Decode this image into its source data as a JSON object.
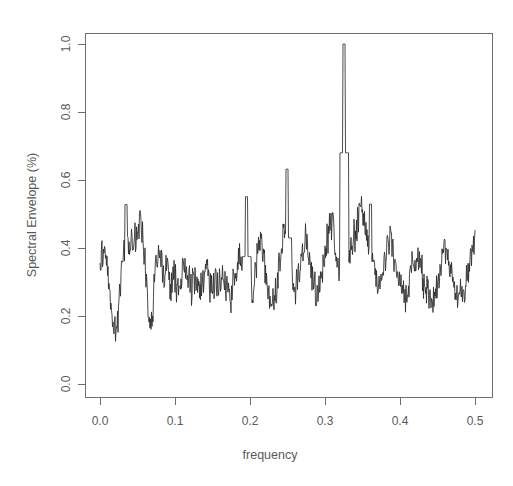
{
  "chart_data": {
    "type": "line",
    "title": "",
    "xlabel": "frequency",
    "ylabel": "Spectral Envelope (%)",
    "xlim": [
      0.0,
      0.5
    ],
    "ylim": [
      0.0,
      1.0
    ],
    "grid": false,
    "legend": null,
    "xticks": [
      "0.0",
      "0.1",
      "0.2",
      "0.3",
      "0.4",
      "0.5"
    ],
    "xtick_values": [
      0.0,
      0.1,
      0.2,
      0.3,
      0.4,
      0.5
    ],
    "yticks": [
      "0.0",
      "0.2",
      "0.4",
      "0.6",
      "0.8",
      "1.0"
    ],
    "ytick_values": [
      0.0,
      0.2,
      0.4,
      0.6,
      0.8,
      1.0
    ],
    "line_color": "#2b2b2b",
    "axis_color": "#6e6e6e",
    "text_color": "#5a5a5a",
    "background": "#ffffff",
    "annotations": [
      {
        "label": "dominant peak",
        "x": 0.3255,
        "y": 1.0
      },
      {
        "label": "secondary peak",
        "x": 0.2495,
        "y": 0.632
      },
      {
        "label": "secondary peak",
        "x": 0.1955,
        "y": 0.551
      },
      {
        "label": "secondary peak",
        "x": 0.3605,
        "y": 0.529
      },
      {
        "label": "secondary peak",
        "x": 0.0345,
        "y": 0.528
      }
    ],
    "x": [
      0.0,
      0.002,
      0.004,
      0.006,
      0.008,
      0.01,
      0.012,
      0.014,
      0.016,
      0.018,
      0.02,
      0.022,
      0.024,
      0.026,
      0.028,
      0.03,
      0.032,
      0.034,
      0.036,
      0.038,
      0.04,
      0.042,
      0.044,
      0.046,
      0.048,
      0.05,
      0.052,
      0.054,
      0.056,
      0.058,
      0.06,
      0.062,
      0.064,
      0.066,
      0.068,
      0.07,
      0.072,
      0.074,
      0.076,
      0.078,
      0.08,
      0.082,
      0.084,
      0.086,
      0.088,
      0.09,
      0.092,
      0.094,
      0.096,
      0.098,
      0.1,
      0.102,
      0.104,
      0.106,
      0.108,
      0.11,
      0.112,
      0.114,
      0.116,
      0.118,
      0.12,
      0.122,
      0.124,
      0.126,
      0.128,
      0.13,
      0.132,
      0.134,
      0.136,
      0.138,
      0.14,
      0.142,
      0.144,
      0.146,
      0.148,
      0.15,
      0.152,
      0.154,
      0.156,
      0.158,
      0.16,
      0.162,
      0.164,
      0.166,
      0.168,
      0.17,
      0.172,
      0.174,
      0.176,
      0.178,
      0.18,
      0.182,
      0.184,
      0.186,
      0.188,
      0.19,
      0.192,
      0.194,
      0.196,
      0.198,
      0.2,
      0.202,
      0.204,
      0.206,
      0.208,
      0.21,
      0.212,
      0.214,
      0.216,
      0.218,
      0.22,
      0.222,
      0.224,
      0.226,
      0.228,
      0.23,
      0.232,
      0.234,
      0.236,
      0.238,
      0.24,
      0.242,
      0.244,
      0.246,
      0.248,
      0.25,
      0.252,
      0.254,
      0.256,
      0.258,
      0.26,
      0.262,
      0.264,
      0.266,
      0.268,
      0.27,
      0.272,
      0.274,
      0.276,
      0.278,
      0.28,
      0.282,
      0.284,
      0.286,
      0.288,
      0.29,
      0.292,
      0.294,
      0.296,
      0.298,
      0.3,
      0.302,
      0.304,
      0.306,
      0.308,
      0.31,
      0.312,
      0.314,
      0.316,
      0.318,
      0.32,
      0.322,
      0.324,
      0.326,
      0.328,
      0.33,
      0.332,
      0.334,
      0.336,
      0.338,
      0.34,
      0.342,
      0.344,
      0.346,
      0.348,
      0.35,
      0.352,
      0.354,
      0.356,
      0.358,
      0.36,
      0.362,
      0.364,
      0.366,
      0.368,
      0.37,
      0.372,
      0.374,
      0.376,
      0.378,
      0.38,
      0.382,
      0.384,
      0.386,
      0.388,
      0.39,
      0.392,
      0.394,
      0.396,
      0.398,
      0.4,
      0.402,
      0.404,
      0.406,
      0.408,
      0.41,
      0.412,
      0.414,
      0.416,
      0.418,
      0.42,
      0.422,
      0.424,
      0.426,
      0.428,
      0.43,
      0.432,
      0.434,
      0.436,
      0.438,
      0.44,
      0.442,
      0.444,
      0.446,
      0.448,
      0.45,
      0.452,
      0.454,
      0.456,
      0.458,
      0.46,
      0.462,
      0.464,
      0.466,
      0.468,
      0.47,
      0.472,
      0.474,
      0.476,
      0.478,
      0.48,
      0.482,
      0.484,
      0.486,
      0.488,
      0.49,
      0.492,
      0.494,
      0.496,
      0.498,
      0.5
    ],
    "y": [
      0.378,
      0.392,
      0.408,
      0.4,
      0.372,
      0.33,
      0.282,
      0.238,
      0.198,
      0.168,
      0.152,
      0.162,
      0.2,
      0.252,
      0.3,
      0.338,
      0.368,
      0.39,
      0.352,
      0.408,
      0.36,
      0.43,
      0.398,
      0.462,
      0.42,
      0.47,
      0.44,
      0.528,
      0.455,
      0.4,
      0.345,
      0.292,
      0.24,
      0.2,
      0.172,
      0.21,
      0.268,
      0.32,
      0.36,
      0.388,
      0.372,
      0.345,
      0.318,
      0.33,
      0.352,
      0.33,
      0.305,
      0.288,
      0.3,
      0.322,
      0.308,
      0.292,
      0.275,
      0.282,
      0.3,
      0.318,
      0.335,
      0.345,
      0.33,
      0.312,
      0.295,
      0.285,
      0.3,
      0.32,
      0.312,
      0.295,
      0.282,
      0.27,
      0.285,
      0.305,
      0.33,
      0.348,
      0.332,
      0.31,
      0.288,
      0.272,
      0.285,
      0.302,
      0.292,
      0.278,
      0.29,
      0.31,
      0.33,
      0.318,
      0.298,
      0.282,
      0.268,
      0.255,
      0.268,
      0.29,
      0.312,
      0.33,
      0.352,
      0.372,
      0.345,
      0.32,
      0.298,
      0.278,
      0.26,
      0.245,
      0.238,
      0.255,
      0.28,
      0.308,
      0.335,
      0.36,
      0.39,
      0.42,
      0.4,
      0.37,
      0.335,
      0.3,
      0.275,
      0.258,
      0.24,
      0.225,
      0.238,
      0.26,
      0.29,
      0.32,
      0.352,
      0.385,
      0.42,
      0.448,
      0.43,
      0.398,
      0.368,
      0.34,
      0.318,
      0.3,
      0.288,
      0.3,
      0.322,
      0.348,
      0.372,
      0.398,
      0.42,
      0.44,
      0.418,
      0.39,
      0.362,
      0.335,
      0.312,
      0.29,
      0.272,
      0.258,
      0.27,
      0.292,
      0.318,
      0.348,
      0.38,
      0.412,
      0.44,
      0.462,
      0.48,
      0.455,
      0.425,
      0.398,
      0.372,
      0.35,
      0.33,
      0.312,
      0.3,
      0.292,
      0.305,
      0.325,
      0.35,
      0.378,
      0.4,
      0.42,
      0.44,
      0.462,
      0.485,
      0.505,
      0.528,
      0.505,
      0.478,
      0.45,
      0.425,
      0.4,
      0.378,
      0.358,
      0.34,
      0.325,
      0.312,
      0.3,
      0.29,
      0.3,
      0.32,
      0.342,
      0.365,
      0.388,
      0.41,
      0.432,
      0.412,
      0.39,
      0.368,
      0.345,
      0.325,
      0.308,
      0.292,
      0.278,
      0.268,
      0.258,
      0.25,
      0.262,
      0.282,
      0.305,
      0.33,
      0.355,
      0.378,
      0.398,
      0.38,
      0.358,
      0.335,
      0.315,
      0.298,
      0.282,
      0.268,
      0.258,
      0.248,
      0.24,
      0.235,
      0.245,
      0.262,
      0.285,
      0.308,
      0.332,
      0.355,
      0.378,
      0.398,
      0.38,
      0.36,
      0.338,
      0.318,
      0.3,
      0.285,
      0.272,
      0.262,
      0.255,
      0.25,
      0.248,
      0.258,
      0.275,
      0.298,
      0.322,
      0.348,
      0.372,
      0.398,
      0.42,
      0.432
    ]
  },
  "axis": {
    "ylabel": "Spectral Envelope (%)",
    "xlabel": "frequency",
    "xtick_0": "0.0",
    "xtick_1": "0.1",
    "xtick_2": "0.2",
    "xtick_3": "0.3",
    "xtick_4": "0.4",
    "xtick_5": "0.5",
    "ytick_0": "0.0",
    "ytick_1": "0.2",
    "ytick_2": "0.4",
    "ytick_3": "0.6",
    "ytick_4": "0.8",
    "ytick_5": "1.0"
  }
}
